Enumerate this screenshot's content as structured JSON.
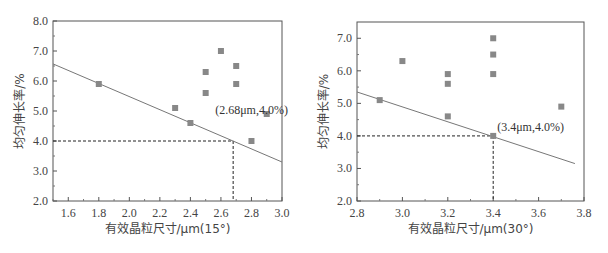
{
  "chart_data": [
    {
      "type": "scatter",
      "title": "",
      "xlabel": "有效晶粒尺寸/μm(15°)",
      "ylabel": "均匀伸长率/%",
      "xlim": [
        1.5,
        3.0
      ],
      "ylim": [
        2.0,
        8.0
      ],
      "xticks": [
        "1.6",
        "1.8",
        "2.0",
        "2.2",
        "2.4",
        "2.6",
        "2.8",
        "3.0"
      ],
      "yticks": [
        "2.0",
        "3.0",
        "4.0",
        "5.0",
        "6.0",
        "7.0",
        "8.0"
      ],
      "grid": false,
      "series": [
        {
          "name": "data",
          "marker": "square",
          "color": "#888888",
          "points": [
            [
              1.8,
              5.9
            ],
            [
              2.3,
              5.1
            ],
            [
              2.4,
              4.6
            ],
            [
              2.5,
              6.3
            ],
            [
              2.5,
              5.6
            ],
            [
              2.6,
              7.0
            ],
            [
              2.7,
              6.5
            ],
            [
              2.7,
              5.9
            ],
            [
              2.8,
              4.0
            ],
            [
              2.9,
              4.9
            ]
          ]
        }
      ],
      "trend_line": [
        [
          1.5,
          6.57
        ],
        [
          3.0,
          3.3
        ]
      ],
      "reference": {
        "x": 2.68,
        "y": 4.0
      },
      "annotation": "(2.68μm,4.0%)"
    },
    {
      "type": "scatter",
      "title": "",
      "xlabel": "有效晶粒尺寸/μm(30°)",
      "ylabel": "均匀伸长率/%",
      "xlim": [
        2.8,
        3.8
      ],
      "ylim": [
        2.0,
        7.5
      ],
      "xticks": [
        "2.8",
        "3.0",
        "3.2",
        "3.4",
        "3.6",
        "3.8"
      ],
      "yticks": [
        "2.0",
        "3.0",
        "4.0",
        "5.0",
        "6.0",
        "7.0"
      ],
      "grid": false,
      "series": [
        {
          "name": "data",
          "marker": "square",
          "color": "#888888",
          "points": [
            [
              2.9,
              5.1
            ],
            [
              3.0,
              6.3
            ],
            [
              3.2,
              5.9
            ],
            [
              3.2,
              5.6
            ],
            [
              3.2,
              4.6
            ],
            [
              3.4,
              7.0
            ],
            [
              3.4,
              6.5
            ],
            [
              3.4,
              5.9
            ],
            [
              3.4,
              4.0
            ],
            [
              3.7,
              4.9
            ]
          ]
        }
      ],
      "trend_line": [
        [
          2.8,
          5.35
        ],
        [
          3.76,
          3.15
        ]
      ],
      "reference": {
        "x": 3.4,
        "y": 4.0
      },
      "annotation": "(3.4μm,4.0%)"
    }
  ]
}
